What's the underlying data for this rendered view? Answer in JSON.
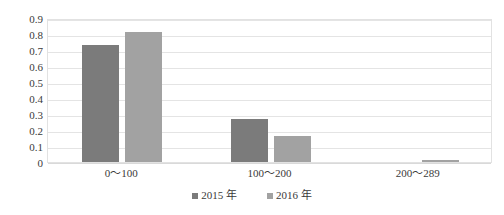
{
  "chart_data": {
    "type": "bar",
    "title": "",
    "subtitle": "",
    "xlabel": "",
    "ylabel": "",
    "categories": [
      "0～100",
      "100～200",
      "200～289"
    ],
    "series": [
      {
        "name": "2015 年",
        "color": "#7b7b7b",
        "values": [
          0.73,
          0.27,
          0
        ]
      },
      {
        "name": "2016 年",
        "color": "#a2a2a2",
        "values": [
          0.81,
          0.16,
          0.015
        ]
      }
    ],
    "ylim": [
      0,
      0.9
    ],
    "ytick_labels": [
      "0.9",
      "0.8",
      "0.7",
      "0.6",
      "0.5",
      "0.4",
      "0.3",
      "0.2",
      "0.1",
      "0"
    ],
    "ytick_values": [
      0.9,
      0.8,
      0.7,
      0.6,
      0.5,
      0.4,
      0.3,
      0.2,
      0.1,
      0
    ],
    "grid": {
      "horizontal": true,
      "vertical": false,
      "color": "#e4e4e4"
    },
    "legend": {
      "position": "bottom",
      "entries": [
        "2015 年",
        "2016 年"
      ]
    },
    "plot_border_color": "#e2e2e2",
    "background": "#ffffff"
  }
}
